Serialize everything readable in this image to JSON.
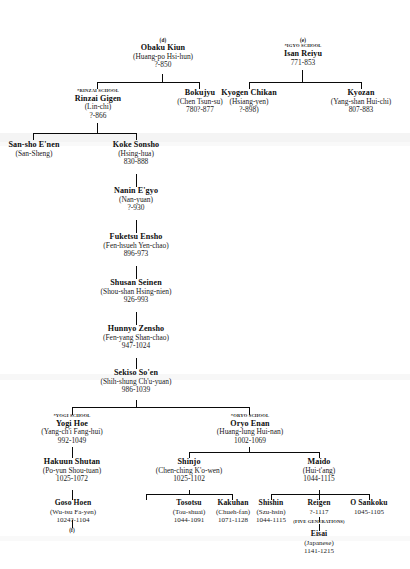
{
  "chart": {
    "title_hidden": "Rinzai Zen Lineage Chart (d) (e)",
    "section_labels": {
      "d": "(d)",
      "e": "(e)",
      "f": "(f)"
    },
    "school_tags": {
      "rinzai": "*RINZAI SCHOOL",
      "igyo": "*IGYO SCHOOL",
      "yogi": "*YOGI SCHOOL",
      "oryo": "*ORYO SCHOOL"
    },
    "notes": {
      "five_generations": "(FIVE GENERATIONS)"
    }
  },
  "nodes": {
    "obaku": {
      "name": "Obaku Kiun",
      "alt": "(Huang-po Hsi-hun)",
      "dates": "?-850"
    },
    "isan": {
      "name": "Isan Reiyu",
      "alt": "",
      "dates": "771-853"
    },
    "rinzai": {
      "name": "Rinzai Gigen",
      "alt": "(Lin-chi)",
      "dates": "?-866"
    },
    "bokujyu": {
      "name": "Bokujyu",
      "alt": "(Chen Tsun-su)",
      "dates": "780?-877"
    },
    "kyogen": {
      "name": "Kyogen Chikan",
      "alt": "(Hsiang-yen)",
      "dates": "?-898)"
    },
    "kyozan": {
      "name": "Kyozan",
      "alt": "(Yang-shan Hui-chi)",
      "dates": "807-883"
    },
    "sansho": {
      "name": "San-sho E'nen",
      "alt": "(San-Sheng)",
      "dates": ""
    },
    "koke": {
      "name": "Koke Sonsho",
      "alt": "(Hsing-hua)",
      "dates": "830-888"
    },
    "nanin": {
      "name": "Nanin E'gyo",
      "alt": "(Nan-yuan)",
      "dates": "?-930"
    },
    "fuketsu": {
      "name": "Fuketsu Ensho",
      "alt": "(Fen-hsueh Yen-chao)",
      "dates": "896-973"
    },
    "shusan": {
      "name": "Shusan  Seinen",
      "alt": "(Shou-shan Hsing-nien)",
      "dates": "926-993"
    },
    "hunnyo": {
      "name": "Hunnyo Zensho",
      "alt": "(Fen-yang Shan-chao)",
      "dates": "947-1024"
    },
    "sekiso": {
      "name": "Sekiso So'en",
      "alt": "(Shih-shung Ch'u-yuan)",
      "dates": "986-1039"
    },
    "yogi": {
      "name": "Yogi Hoe",
      "alt": "(Yang-ch'i Fang-hui)",
      "dates": "992-1049"
    },
    "oryo": {
      "name": "Oryo Enan",
      "alt": "(Huang-lung Hui-nan)",
      "dates": "1002-1069"
    },
    "hakuun": {
      "name": "Hakuun Shutan",
      "alt": "(Po-yun Shou-tuan)",
      "dates": "1025-1072"
    },
    "shinjo": {
      "name": "Shinjo",
      "alt": "(Chen-ching K'o-wen)",
      "dates": "1025-1102"
    },
    "maido": {
      "name": "Maido",
      "alt": "(Hui-t'ang)",
      "dates": "1044-1115"
    },
    "goso": {
      "name": "Goso Hoen",
      "alt": "(Wu-tsu Fa-yen)",
      "dates": "1024?-1104"
    },
    "tosotsu": {
      "name": "Tosotsu",
      "alt": "(Tou-shuai)",
      "dates": "1044-1091"
    },
    "kakuhan": {
      "name": "Kakuhan",
      "alt": "(Chueh-fan)",
      "dates": "1071-1128"
    },
    "shishin": {
      "name": "Shishin",
      "alt": "(Szu-hsin)",
      "dates": "1044-1115"
    },
    "reigen": {
      "name": "Reigen",
      "alt": "",
      "dates": "?-1117"
    },
    "osankoku": {
      "name": "O Sankoku",
      "alt": "",
      "dates": "1045-1105"
    },
    "eisai": {
      "name": "Eisai",
      "alt": "(Japanese)",
      "dates": "1141-1215"
    }
  }
}
